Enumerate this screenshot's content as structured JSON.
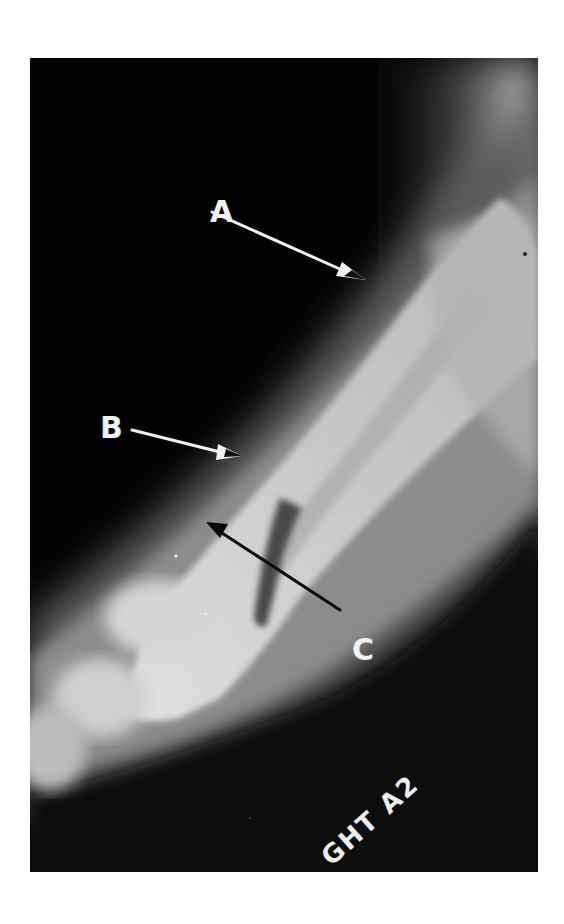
{
  "figure": {
    "type": "radiograph",
    "labels": [
      {
        "id": "A",
        "text": "A",
        "arrow_color": "#f0f0f0",
        "points_to": "upper cortex of diaphysis"
      },
      {
        "id": "B",
        "text": "B",
        "arrow_color": "#f0f0f0",
        "points_to": "cortical margin"
      },
      {
        "id": "C",
        "text": "C",
        "arrow_color": "#0a0a0a",
        "points_to": "distal metaphysis"
      }
    ],
    "plate_marker": "GHT A2",
    "colors": {
      "background": "#ffffff",
      "film_dark": "#030303",
      "soft_tissue": "#6a6a6a",
      "bone_light": "#cfcfcf",
      "label_text": "#f2f2f2"
    }
  }
}
